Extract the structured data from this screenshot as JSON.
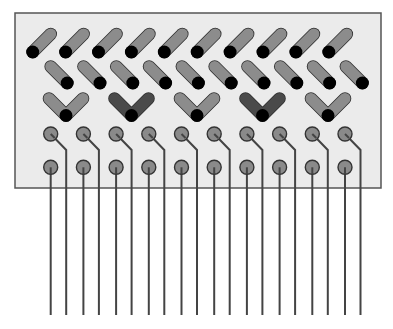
{
  "diagram": {
    "width": 393,
    "height": 329,
    "colors": {
      "page_bg": "#ffffff",
      "panel_bg": "#ebebeb",
      "panel_border": "#555555",
      "bar_light": "#8c8c8c",
      "bar_dark": "#4a4a4a",
      "bar_outline": "#2e2e2e",
      "dot": "#000000",
      "pin_fill": "#8a8a8a",
      "pin_stroke": "#333333",
      "wire": "#444444"
    },
    "panel": {
      "x": 15,
      "y": 13,
      "w": 366,
      "h": 175
    },
    "row1_diagonals": {
      "count": 10,
      "start_x": 32.7,
      "pitch": 32.9,
      "dot_y": 52,
      "dx": 18,
      "dy": -18,
      "stroke_width": 11
    },
    "row2_diagonals": {
      "count": 10,
      "start_x": 50.7,
      "pitch": 32.8,
      "top_y": 66.5,
      "dx": 16.5,
      "dy": 16.5,
      "stroke_width": 11
    },
    "row3_vees": {
      "items": [
        {
          "x": 66,
          "tone": "light"
        },
        {
          "x": 131.5,
          "tone": "dark"
        },
        {
          "x": 197,
          "tone": "light"
        },
        {
          "x": 262.5,
          "tone": "dark"
        },
        {
          "x": 328,
          "tone": "light"
        }
      ],
      "bottom_y": 115.5,
      "arm_dx": 17,
      "arm_dy": -17,
      "stroke_width": 11
    },
    "pins": {
      "count": 10,
      "start_x": 50.7,
      "pitch": 32.7,
      "radius": 7,
      "upper_y": 134,
      "lower_y": 167.3,
      "upper_wire_offset_x": 15.5,
      "upper_wire_bend_y": 150
    },
    "wires": {
      "end_y": 315,
      "stroke_width": 2
    }
  }
}
